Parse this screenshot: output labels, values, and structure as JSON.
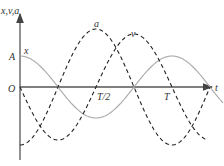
{
  "labels": {
    "y_axis": "x,v,a",
    "x_axis": "t",
    "origin": "O",
    "amplitude": "A",
    "half_period": "T/2",
    "period": "T",
    "curve_x": "x",
    "curve_v": "v",
    "curve_a": "a"
  },
  "colors": {
    "axis": "#444444",
    "x_curve": "#aaaaaa",
    "dashed": "#222222"
  }
}
